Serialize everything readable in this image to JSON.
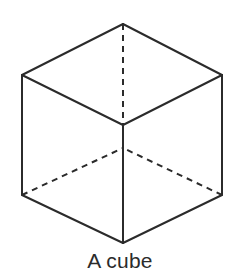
{
  "figure": {
    "title": "A cube",
    "caption": "A cube",
    "kind": "line-drawing",
    "subject": "cube",
    "projection": "isometric-hexagonal",
    "background_color": "#ffffff",
    "stroke_color": "#2b2b2b",
    "caption_color": "#2b2b2b",
    "stroke_width": 2,
    "dash_pattern": "6 5",
    "canvas": {
      "width": 240,
      "height": 277
    },
    "vertices": {
      "top": {
        "x": 123,
        "y": 24,
        "label": "top-vertex",
        "hidden": false
      },
      "upper_left": {
        "x": 22,
        "y": 75,
        "label": "upper-left-vertex",
        "hidden": false
      },
      "upper_right": {
        "x": 222,
        "y": 75,
        "label": "upper-right-vertex",
        "hidden": false
      },
      "center_front": {
        "x": 123,
        "y": 125,
        "label": "front-center-vertex",
        "hidden": false
      },
      "center_back": {
        "x": 123,
        "y": 148,
        "label": "back-hidden-vertex",
        "hidden": true
      },
      "lower_left": {
        "x": 22,
        "y": 195,
        "label": "lower-left-vertex",
        "hidden": false
      },
      "lower_right": {
        "x": 222,
        "y": 195,
        "label": "lower-right-vertex",
        "hidden": false
      },
      "bottom": {
        "x": 123,
        "y": 243,
        "label": "bottom-vertex",
        "hidden": false
      }
    },
    "edges": [
      {
        "name": "outline-top-left",
        "from": "top",
        "to": "upper_left",
        "style": "solid"
      },
      {
        "name": "outline-top-right",
        "from": "top",
        "to": "upper_right",
        "style": "solid"
      },
      {
        "name": "outline-left-side",
        "from": "upper_left",
        "to": "lower_left",
        "style": "solid"
      },
      {
        "name": "outline-right-side",
        "from": "upper_right",
        "to": "lower_right",
        "style": "solid"
      },
      {
        "name": "outline-bottom-left",
        "from": "lower_left",
        "to": "bottom",
        "style": "solid"
      },
      {
        "name": "outline-bottom-right",
        "from": "lower_right",
        "to": "bottom",
        "style": "solid"
      },
      {
        "name": "top-face-left-edge",
        "from": "upper_left",
        "to": "center_front",
        "style": "solid"
      },
      {
        "name": "top-face-right-edge",
        "from": "upper_right",
        "to": "center_front",
        "style": "solid"
      },
      {
        "name": "front-vertical-edge",
        "from": "center_front",
        "to": "bottom",
        "style": "solid"
      },
      {
        "name": "hidden-vertical-edge",
        "from": "top",
        "to": "center_front",
        "style": "dashed"
      },
      {
        "name": "hidden-left-edge",
        "from": "lower_left",
        "to": "center_back",
        "style": "dashed"
      },
      {
        "name": "hidden-right-edge",
        "from": "lower_right",
        "to": "center_back",
        "style": "dashed"
      }
    ]
  }
}
